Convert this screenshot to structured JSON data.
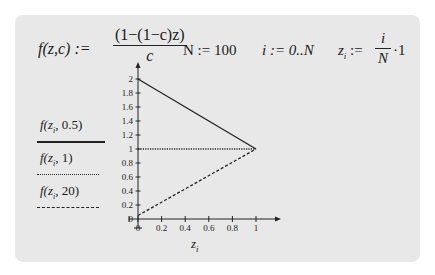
{
  "worksheet": {
    "function_def": {
      "lhs": "f(z,c) :=",
      "numerator": "(1−(1−c)z)",
      "denominator": "c"
    },
    "n_def": "N := 100",
    "i_def": "i := 0..N",
    "z_def": {
      "lhs": "z",
      "lhs_sub": "i",
      "assign": " :=",
      "numerator": "i",
      "denominator": "N",
      "tail": "·1"
    },
    "colors": {
      "card_bg": "#e8e8e8",
      "line": "#222222"
    }
  },
  "chart_data": {
    "type": "line",
    "title": "",
    "xlabel": "z_i",
    "ylabel": "",
    "xlim": [
      0,
      1
    ],
    "ylim": [
      0,
      2
    ],
    "x_ticks": [
      "0",
      "0.2",
      "0.4",
      "0.6",
      "0.8",
      "1"
    ],
    "y_ticks": [
      "0",
      "0.2",
      "0.4",
      "0.6",
      "0.8",
      "1",
      "1.2",
      "1.4",
      "1.6",
      "1.8",
      "2"
    ],
    "grid": false,
    "legend_placement": "left",
    "series": [
      {
        "name": "f(z_i, 0.5)",
        "label_fn": "f",
        "label_arg": "z",
        "label_sub": "i",
        "label_param": "0.5",
        "style": "solid",
        "x": [
          0,
          1
        ],
        "y": [
          2,
          1
        ]
      },
      {
        "name": "f(z_i, 1)",
        "label_fn": "f",
        "label_arg": "z",
        "label_sub": "i",
        "label_param": "1",
        "style": "dotted",
        "x": [
          0,
          1
        ],
        "y": [
          1,
          1
        ]
      },
      {
        "name": "f(z_i, 20)",
        "label_fn": "f",
        "label_arg": "z",
        "label_sub": "i",
        "label_param": "20",
        "style": "dashed",
        "x": [
          0,
          1
        ],
        "y": [
          0.05,
          1
        ]
      }
    ]
  }
}
